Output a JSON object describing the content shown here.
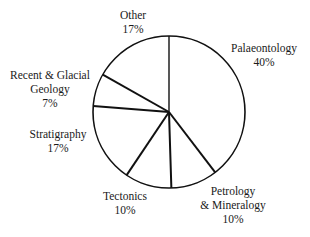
{
  "chart_data": {
    "type": "pie",
    "title": "",
    "start_angle_deg": 0,
    "direction": "clockwise",
    "slices": [
      {
        "label": "Palaeontology",
        "value": 40,
        "display": "40%"
      },
      {
        "label": "Petrology & Mineralogy",
        "value": 10,
        "display": "10%"
      },
      {
        "label": "Tectonics",
        "value": 10,
        "display": "10%"
      },
      {
        "label": "Stratigraphy",
        "value": 17,
        "display": "17%"
      },
      {
        "label": "Recent & Glacial Geology",
        "value": 7,
        "display": "7%"
      },
      {
        "label": "Other",
        "value": 17,
        "display": "17%"
      }
    ],
    "categories": [
      "Palaeontology",
      "Petrology & Mineralogy",
      "Tectonics",
      "Stratigraphy",
      "Recent & Glacial Geology",
      "Other"
    ],
    "values": [
      40,
      10,
      10,
      17,
      7,
      17
    ],
    "legend": "none (labels placed beside slices)",
    "fill": "none (outline only)",
    "stroke_color": "#111111"
  },
  "labels": {
    "palaeontology": {
      "line1": "Palaeontology",
      "pct": "40%"
    },
    "petrology": {
      "line1": "Petrology",
      "line2": "& Mineralogy",
      "pct": "10%"
    },
    "tectonics": {
      "line1": "Tectonics",
      "pct": "10%"
    },
    "stratigraphy": {
      "line1": "Stratigraphy",
      "pct": "17%"
    },
    "recent": {
      "line1": "Recent & Glacial",
      "line2": "Geology",
      "pct": "7%"
    },
    "other": {
      "line1": "Other",
      "pct": "17%"
    }
  }
}
